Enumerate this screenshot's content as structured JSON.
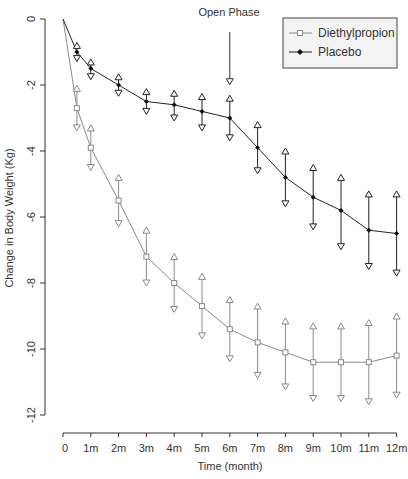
{
  "chart_data": {
    "type": "line",
    "title": "",
    "xlabel": "Time (month)",
    "ylabel": "Change in Body Weight (Kg)",
    "xlim": [
      0,
      12
    ],
    "ylim": [
      -12,
      0
    ],
    "x_ticks": [
      {
        "value": 0,
        "label": "0"
      },
      {
        "value": 1,
        "label": "1m"
      },
      {
        "value": 2,
        "label": "2m"
      },
      {
        "value": 3,
        "label": "3m"
      },
      {
        "value": 4,
        "label": "4m"
      },
      {
        "value": 5,
        "label": "5m"
      },
      {
        "value": 6,
        "label": "6m"
      },
      {
        "value": 7,
        "label": "7m"
      },
      {
        "value": 8,
        "label": "8m"
      },
      {
        "value": 9,
        "label": "9m"
      },
      {
        "value": 10,
        "label": "10m"
      },
      {
        "value": 11,
        "label": "11m"
      },
      {
        "value": 12,
        "label": "12m"
      }
    ],
    "y_ticks": [
      {
        "value": 0,
        "label": "0"
      },
      {
        "value": -2,
        "label": "-2"
      },
      {
        "value": -4,
        "label": "-4"
      },
      {
        "value": -6,
        "label": "-6"
      },
      {
        "value": -8,
        "label": "-8"
      },
      {
        "value": -10,
        "label": "-10"
      },
      {
        "value": -12,
        "label": "-12"
      }
    ],
    "grid": false,
    "legend_position": "top-right",
    "annotations": [
      {
        "text": "Open Phase",
        "x": 6,
        "arrow_from_y": -0.9,
        "arrow_to_y": -1.9
      }
    ],
    "series": [
      {
        "name": "Diethylpropion",
        "color": "#8a8a8a",
        "marker": "square",
        "x": [
          0,
          0.5,
          1,
          2,
          3,
          4,
          5,
          6,
          7,
          8,
          9,
          10,
          11,
          12
        ],
        "values": [
          0,
          -2.7,
          -3.9,
          -5.5,
          -7.2,
          -8.0,
          -8.7,
          -9.4,
          -9.8,
          -10.1,
          -10.4,
          -10.4,
          -10.4,
          -10.2
        ],
        "upper": [
          null,
          -2.1,
          -3.3,
          -4.8,
          -6.4,
          -7.2,
          -7.8,
          -8.5,
          -8.7,
          -9.15,
          -9.3,
          -9.3,
          -9.2,
          -9.0
        ],
        "lower": [
          null,
          -3.3,
          -4.5,
          -6.2,
          -8.0,
          -8.8,
          -9.6,
          -10.3,
          -10.8,
          -11.15,
          -11.5,
          -11.5,
          -11.6,
          -11.4
        ]
      },
      {
        "name": "Placebo",
        "color": "#222222",
        "marker": "diamond",
        "x": [
          0,
          0.5,
          1,
          2,
          3,
          4,
          5,
          6,
          7,
          8,
          9,
          10,
          11,
          12
        ],
        "values": [
          0,
          -1.0,
          -1.5,
          -2.0,
          -2.5,
          -2.6,
          -2.8,
          -3.0,
          -3.9,
          -4.8,
          -5.4,
          -5.8,
          -6.4,
          -6.5
        ],
        "upper": [
          null,
          -0.8,
          -1.3,
          -1.75,
          -2.2,
          -2.25,
          -2.35,
          -2.4,
          -3.2,
          -4.0,
          -4.5,
          -4.8,
          -5.3,
          -5.3
        ],
        "lower": [
          null,
          -1.2,
          -1.75,
          -2.25,
          -2.8,
          -3.0,
          -3.3,
          -3.6,
          -4.6,
          -5.6,
          -6.3,
          -6.9,
          -7.5,
          -7.7
        ]
      }
    ]
  },
  "legend": {
    "items": [
      {
        "label": "Diethylpropion"
      },
      {
        "label": "Placebo"
      }
    ]
  },
  "annotation": {
    "open_phase": "Open Phase"
  },
  "axes": {
    "xlabel": "Time (month)",
    "ylabel": "Change in Body Weight (Kg)"
  }
}
